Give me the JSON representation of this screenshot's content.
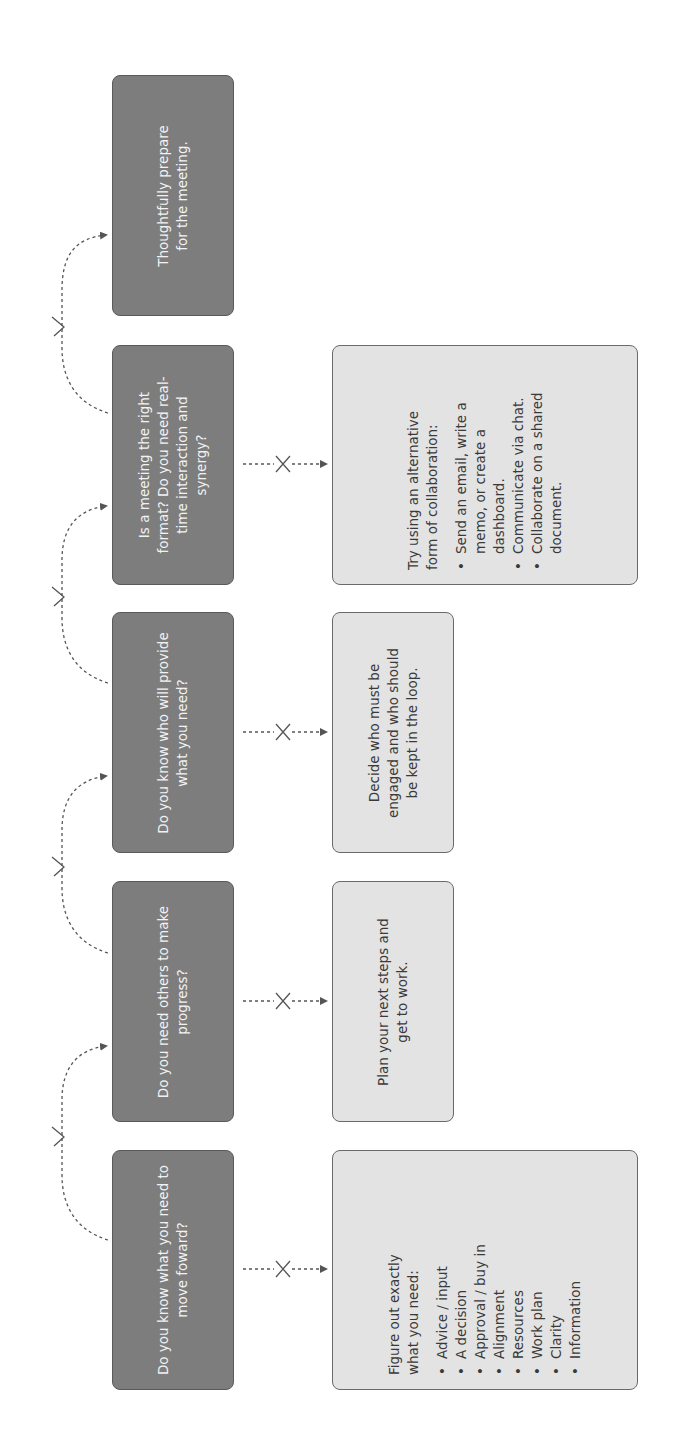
{
  "diagram": {
    "orientation": "rotated-90-ccw",
    "colors": {
      "question_box": "#7d7d7d",
      "answer_box": "#e3e3e3",
      "connector": "#555555",
      "background": "#ffffff"
    },
    "steps": [
      {
        "question": "Do you know what you need to move foward?",
        "yes_marker": "check-icon",
        "no_marker": "x-icon",
        "no_answer": {
          "lead": "Figure out exactly what you need:",
          "items": [
            "Advice / input",
            "A decision",
            "Approval / buy in",
            "Alignment",
            "Resources",
            "Work plan",
            "Clarity",
            "Information"
          ]
        }
      },
      {
        "question": "Do you need others to make progress?",
        "yes_marker": "check-icon",
        "no_marker": "x-icon",
        "no_answer": {
          "lead": "Plan your next steps and get to work.",
          "items": []
        }
      },
      {
        "question": "Do you know who will provide what you need?",
        "yes_marker": "check-icon",
        "no_marker": "x-icon",
        "no_answer": {
          "lead": "Decide who must be engaged and who should be kept in the loop.",
          "items": []
        }
      },
      {
        "question": "Is a meeting the right format? Do you need real-time interaction and synergy?",
        "yes_marker": "check-icon",
        "no_marker": "x-icon",
        "no_answer": {
          "lead": "Try using an alternative form of collaboration:",
          "items": [
            "Send an email, write a memo, or create a dashboard.",
            "Communicate via chat.",
            "Collaborate on a shared document."
          ]
        }
      },
      {
        "question": "Thoughtfully prepare for the meeting.",
        "yes_marker": null,
        "no_marker": null,
        "no_answer": null
      }
    ]
  }
}
